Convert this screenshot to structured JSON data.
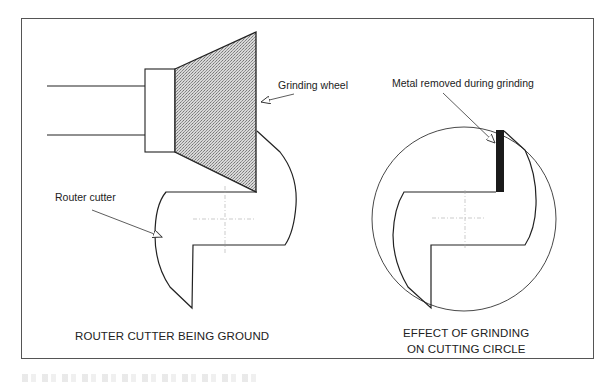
{
  "figure": {
    "left_panel": {
      "labels": {
        "grinding_wheel": "Grinding wheel",
        "router_cutter": "Router cutter"
      },
      "title": "ROUTER CUTTER BEING GROUND"
    },
    "right_panel": {
      "labels": {
        "metal_removed": "Metal removed during grinding"
      },
      "title_line1": "EFFECT OF GRINDING",
      "title_line2": "ON CUTTING CIRCLE"
    },
    "caption": ""
  },
  "colors": {
    "line": "#222222",
    "frame": "#555555",
    "wheel_fill": "#b5b5b5",
    "removed_metal": "#1a1a1a",
    "centerline": "#aaaaaa"
  }
}
